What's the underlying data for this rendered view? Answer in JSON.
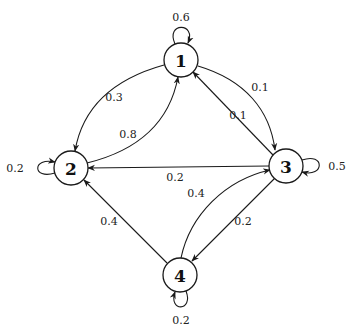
{
  "diagram": {
    "type": "markov-chain",
    "nodes": [
      {
        "id": "1",
        "label": "1",
        "x": 181,
        "y": 60
      },
      {
        "id": "2",
        "label": "2",
        "x": 71,
        "y": 168
      },
      {
        "id": "3",
        "label": "3",
        "x": 286,
        "y": 166
      },
      {
        "id": "4",
        "label": "4",
        "x": 180,
        "y": 275
      }
    ],
    "edges": [
      {
        "from": "1",
        "to": "1",
        "label": "0.6"
      },
      {
        "from": "1",
        "to": "2",
        "label": "0.3"
      },
      {
        "from": "1",
        "to": "3",
        "label": "0.1"
      },
      {
        "from": "2",
        "to": "2",
        "label": "0.2"
      },
      {
        "from": "2",
        "to": "1",
        "label": "0.8"
      },
      {
        "from": "3",
        "to": "1",
        "label": "0.1"
      },
      {
        "from": "3",
        "to": "2",
        "label": "0.2"
      },
      {
        "from": "3",
        "to": "3",
        "label": "0.5"
      },
      {
        "from": "3",
        "to": "4",
        "label": "0.2"
      },
      {
        "from": "4",
        "to": "2",
        "label": "0.4"
      },
      {
        "from": "4",
        "to": "3",
        "label": "0.4"
      },
      {
        "from": "4",
        "to": "4",
        "label": "0.2"
      }
    ]
  },
  "labels": {
    "n1": "1",
    "n2": "2",
    "n3": "3",
    "n4": "4",
    "e11": "0.6",
    "e12": "0.3",
    "e13": "0.1",
    "e22": "0.2",
    "e21": "0.8",
    "e31": "0.1",
    "e32": "0.2",
    "e33": "0.5",
    "e34": "0.2",
    "e42": "0.4",
    "e43": "0.4",
    "e44": "0.2"
  }
}
